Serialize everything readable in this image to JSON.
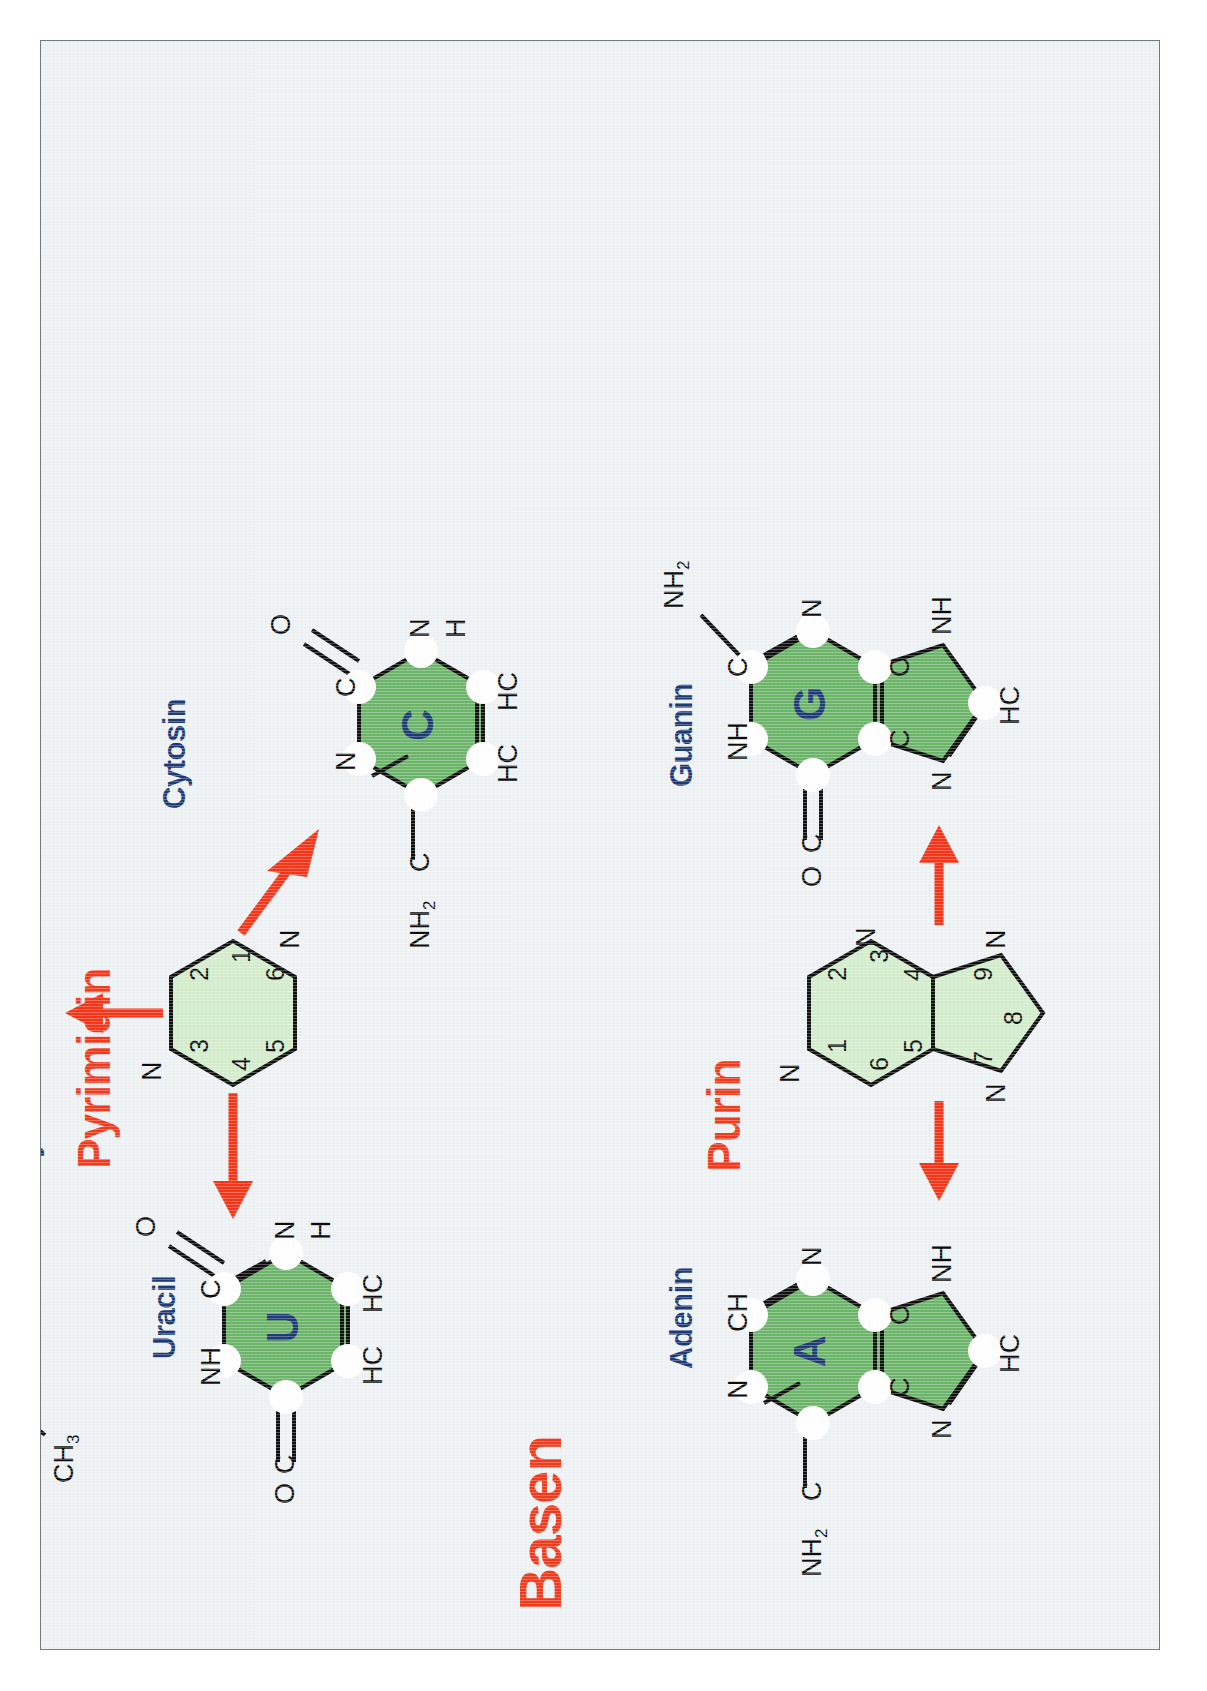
{
  "poster": {
    "title": "Basen",
    "title_color": "#f03c1e",
    "name_color": "#1f3b77",
    "ring_dark_color": "#6cb56a",
    "ring_light_color": "#d4edcd",
    "sheet_color": "#eef2f4",
    "arrow_color": "#f4361a",
    "language": "de",
    "orientation": "rotated-90-clockwise"
  },
  "groups": [
    {
      "label": "Pyrimidin",
      "ring_numbers": [
        "1",
        "2",
        "3",
        "4",
        "5",
        "6"
      ],
      "ring_heteroatoms": [
        "N",
        "N"
      ]
    },
    {
      "label": "Purin",
      "ring_numbers": [
        "1",
        "2",
        "3",
        "4",
        "5",
        "6",
        "7",
        "8",
        "9"
      ],
      "ring_heteroatoms": [
        "N",
        "N",
        "N",
        "N"
      ]
    }
  ],
  "molecules": [
    {
      "name": "Thymin",
      "letter": "T",
      "group": "Pyrimidin",
      "ring_atoms": [
        "NH",
        "C",
        "N",
        "HC",
        "C",
        "C"
      ],
      "substituents": [
        "O",
        "O",
        "H",
        "CH",
        "3"
      ],
      "labels": {
        "nh": "NH",
        "c_top_right": "C",
        "o_top": "O",
        "n_right": "N",
        "h_right": "H",
        "hc": "HC",
        "c_bottom_left": "C",
        "ch3": "CH",
        "ch3_sub": "3",
        "c_left": "C",
        "o_left": "O"
      }
    },
    {
      "name": "Uracil",
      "letter": "U",
      "group": "Pyrimidin",
      "ring_atoms": [
        "NH",
        "C",
        "N",
        "HC",
        "HC",
        "C"
      ],
      "labels": {
        "nh": "NH",
        "c_top_right": "C",
        "o_top": "O",
        "n_right": "N",
        "h_right": "H",
        "hc_br": "HC",
        "hc_bl": "HC",
        "c_left": "C",
        "o_left": "O"
      }
    },
    {
      "name": "Cytosin",
      "letter": "C",
      "group": "Pyrimidin",
      "ring_atoms": [
        "N",
        "C",
        "N",
        "HC",
        "HC",
        "C"
      ],
      "labels": {
        "n_top_left": "N",
        "c_top_right": "C",
        "o_top": "O",
        "n_right": "N",
        "h_right": "H",
        "hc_br": "HC",
        "hc_bl": "HC",
        "c_left": "C",
        "nh2": "NH",
        "nh2_sub": "2"
      }
    },
    {
      "name": "Adenin",
      "letter": "A",
      "group": "Purin",
      "ring_atoms": [
        "N",
        "CH",
        "N",
        "C",
        "C",
        "C"
      ],
      "five_ring_atoms": [
        "N",
        "HC",
        "NH"
      ],
      "labels": {
        "n_top_left": "N",
        "ch_top_right": "CH",
        "n_right": "N",
        "c_br": "C",
        "c_bl": "C",
        "c_left": "C",
        "nh2": "NH",
        "nh2_sub": "2",
        "n5": "N",
        "hc5": "HC",
        "nh5": "NH",
        "h5": "H"
      }
    },
    {
      "name": "Guanin",
      "letter": "G",
      "group": "Purin",
      "ring_atoms": [
        "NH",
        "C",
        "N",
        "C",
        "C",
        "C"
      ],
      "five_ring_atoms": [
        "N",
        "HC",
        "NH"
      ],
      "labels": {
        "nh_top_left": "NH",
        "c_top_right": "C",
        "nh2": "NH",
        "nh2_sub": "2",
        "n_right": "N",
        "c_br": "C",
        "c_bl": "C",
        "c_left": "C",
        "o_left": "O",
        "n5": "N",
        "hc5": "HC",
        "nh5": "NH",
        "h5": "H"
      }
    }
  ]
}
